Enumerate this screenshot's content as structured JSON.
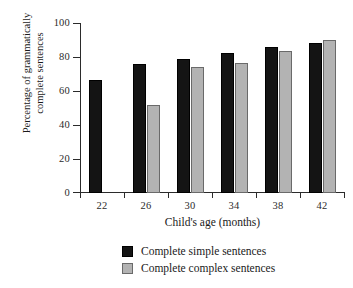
{
  "chart_data": {
    "type": "bar",
    "title": "",
    "xlabel": "Child's age (months)",
    "ylabel": "Percentage of grammatically complete sentences",
    "ylabel_lines": [
      "Percentage of grammatically",
      "complete sentences"
    ],
    "categories": [
      "22",
      "26",
      "30",
      "34",
      "38",
      "42"
    ],
    "ylim": [
      0,
      100
    ],
    "yticks": [
      0,
      20,
      40,
      60,
      80,
      100
    ],
    "ytick_labels": [
      "0",
      "20",
      "40",
      "60",
      "80",
      "100"
    ],
    "grid": false,
    "legend_position": "below-axes",
    "series": [
      {
        "name": "Complete simple sentences",
        "color": "#141414",
        "values": [
          66.5,
          76,
          79,
          82.5,
          86,
          88.5
        ]
      },
      {
        "name": "Complete complex sentences",
        "color": "#b3b3b3",
        "values": [
          null,
          52,
          74,
          76.5,
          83.5,
          90
        ]
      }
    ]
  },
  "legend": {
    "items": [
      {
        "label": "Complete simple sentences",
        "swatch": "black-square"
      },
      {
        "label": "Complete complex sentences",
        "swatch": "gray-square"
      }
    ]
  },
  "colors": {
    "simple": "#141414",
    "complex": "#b3b3b3",
    "axis": "#2b2b2b",
    "background": "#ffffff"
  }
}
